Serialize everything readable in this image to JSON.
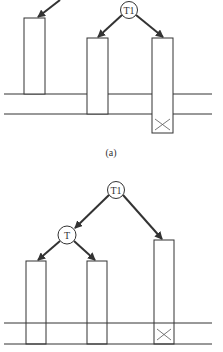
{
  "figure_a": {
    "caption": "(a)",
    "root_node": "T1"
  },
  "figure_b": {
    "root_node": "T1",
    "child_node": "T"
  },
  "colors": {
    "stroke": "#333333",
    "background": "#ffffff"
  }
}
